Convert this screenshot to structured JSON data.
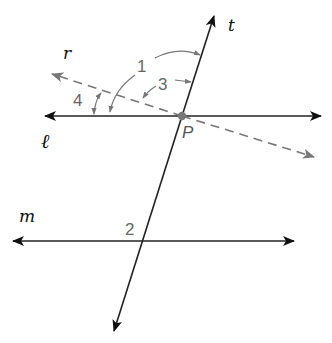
{
  "diagram": {
    "type": "parallel lines cut by transversal",
    "lines": {
      "t": {
        "label": "t",
        "style": "solid",
        "from": [
          113,
          333
        ],
        "to": [
          215,
          14
        ]
      },
      "l": {
        "label": "ℓ",
        "style": "solid",
        "from": [
          43,
          116
        ],
        "to": [
          323,
          116
        ]
      },
      "m": {
        "label": "m",
        "style": "solid",
        "from": [
          11,
          241
        ],
        "to": [
          296,
          241
        ]
      },
      "r": {
        "label": "r",
        "style": "dashed",
        "from": [
          50,
          73
        ],
        "to": [
          316,
          158
        ]
      }
    },
    "point": {
      "label": "P",
      "x": 182,
      "y": 116
    },
    "angles": [
      {
        "label": "1",
        "between": [
          "ℓ",
          "t"
        ]
      },
      {
        "label": "2",
        "on": "m"
      },
      {
        "label": "3",
        "between": [
          "r",
          "t"
        ]
      },
      {
        "label": "4",
        "between": [
          "ℓ",
          "r"
        ]
      }
    ],
    "colors": {
      "solid": "#222222",
      "dashed": "#777777",
      "labels": "#666666"
    }
  }
}
